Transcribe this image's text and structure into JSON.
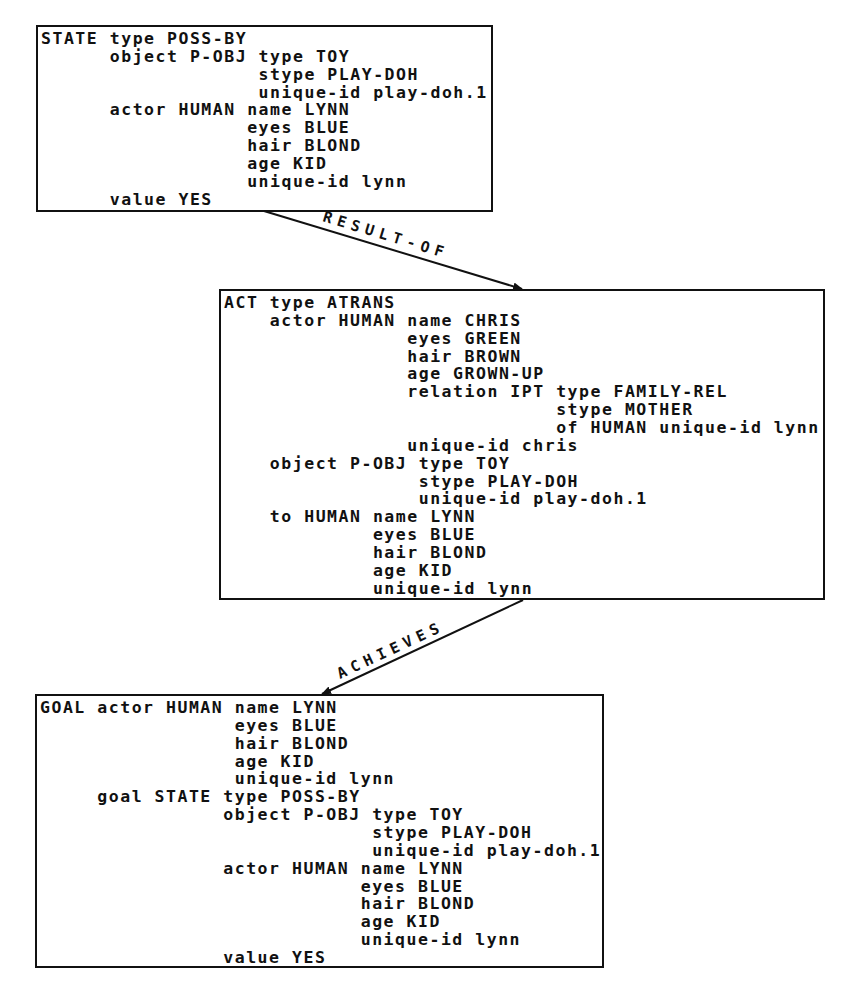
{
  "frames": {
    "state": {
      "lines": [
        "STATE type POSS-BY",
        "      object P-OBJ type TOY",
        "                   stype PLAY-DOH",
        "                   unique-id play-doh.1",
        "      actor HUMAN name LYNN",
        "                  eyes BLUE",
        "                  hair BLOND",
        "                  age KID",
        "                  unique-id lynn",
        "      value YES"
      ]
    },
    "act": {
      "lines": [
        "ACT type ATRANS",
        "    actor HUMAN name CHRIS",
        "                eyes GREEN",
        "                hair BROWN",
        "                age GROWN-UP",
        "                relation IPT type FAMILY-REL",
        "                             stype MOTHER",
        "                             of HUMAN unique-id lynn",
        "                unique-id chris",
        "    object P-OBJ type TOY",
        "                 stype PLAY-DOH",
        "                 unique-id play-doh.1",
        "    to HUMAN name LYNN",
        "             eyes BLUE",
        "             hair BLOND",
        "             age KID",
        "             unique-id lynn"
      ]
    },
    "goal": {
      "lines": [
        "GOAL actor HUMAN name LYNN",
        "                 eyes BLUE",
        "                 hair BLOND",
        "                 age KID",
        "                 unique-id lynn",
        "     goal STATE type POSS-BY",
        "                object P-OBJ type TOY",
        "                             stype PLAY-DOH",
        "                             unique-id play-doh.1",
        "                actor HUMAN name LYNN",
        "                            eyes BLUE",
        "                            hair BLOND",
        "                            age KID",
        "                            unique-id lynn",
        "                value YES"
      ]
    }
  },
  "links": {
    "result_of": {
      "label": "RESULT-OF",
      "from": "state",
      "to": "act"
    },
    "achieves": {
      "label": "ACHIEVES",
      "from": "act",
      "to": "goal"
    }
  },
  "colors": {
    "ink": "#111111",
    "background": "#ffffff"
  }
}
